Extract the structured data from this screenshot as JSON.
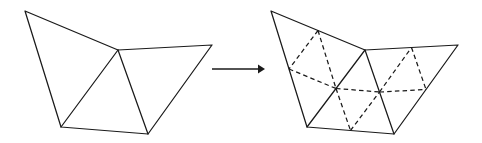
{
  "figure": {
    "description": "A coarse triangular mesh of three triangles is transformed by an arrow into the same mesh with each triangle subdivided into four smaller triangles by dashed midpoint lines.",
    "background_color": "#ffffff",
    "line_color": "#1a1a1a",
    "solid_stroke_width": 1.25,
    "dashed_stroke_width": 1.25,
    "dash_pattern": "4.5 3.2"
  },
  "left_panel": {
    "label": "coarse-mesh",
    "caption": "",
    "vertices": {
      "top_left": {
        "name": "A",
        "x": 25,
        "y": 11
      },
      "apex": {
        "name": "B",
        "x": 118,
        "y": 50
      },
      "right": {
        "name": "C",
        "x": 212,
        "y": 45
      },
      "bottom_left": {
        "name": "D",
        "x": 61,
        "y": 127
      },
      "bottom_mid": {
        "name": "E",
        "x": 148,
        "y": 134
      }
    },
    "outline_path": "M 25 11 L 118 50 L 212 45 L 148 134 L 61 127 Z",
    "interior_edges": [
      {
        "name": "edge-apex-bottom-left",
        "from": "apex",
        "to": "bottom_left"
      },
      {
        "name": "edge-apex-bottom-mid",
        "from": "apex",
        "to": "bottom_mid"
      }
    ],
    "triangles": [
      {
        "name": "triangle-left",
        "vertices": [
          "top_left",
          "apex",
          "bottom_left"
        ]
      },
      {
        "name": "triangle-middle",
        "vertices": [
          "apex",
          "bottom_left",
          "bottom_mid"
        ]
      },
      {
        "name": "triangle-right",
        "vertices": [
          "apex",
          "right",
          "bottom_mid"
        ]
      }
    ]
  },
  "arrow": {
    "label": "transform-arrow",
    "caption": "",
    "shaft_x1": 212,
    "shaft_x2": 258,
    "y": 69,
    "head_points": "258,64.5 265,69 258,73.5"
  },
  "right_panel": {
    "label": "refined-mesh",
    "caption": "",
    "vertices": {
      "top_left": {
        "name": "A'",
        "x": 271,
        "y": 11
      },
      "apex": {
        "name": "B'",
        "x": 365,
        "y": 50
      },
      "right": {
        "name": "C'",
        "x": 458,
        "y": 45
      },
      "bottom_left": {
        "name": "D'",
        "x": 307,
        "y": 127
      },
      "bottom_mid": {
        "name": "E'",
        "x": 394,
        "y": 134
      }
    },
    "outline_path": "M 271 11 L 365 50 L 458 45 L 394 134 L 307 127 Z",
    "interior_edges": [
      {
        "name": "edge-apex-bottom-left",
        "from": "apex",
        "to": "bottom_left"
      },
      {
        "name": "edge-apex-bottom-mid",
        "from": "apex",
        "to": "bottom_mid"
      }
    ],
    "triangles": [
      {
        "name": "triangle-left",
        "vertices": [
          "top_left",
          "apex",
          "bottom_left"
        ]
      },
      {
        "name": "triangle-middle",
        "vertices": [
          "apex",
          "bottom_left",
          "bottom_mid"
        ]
      },
      {
        "name": "triangle-right",
        "vertices": [
          "apex",
          "right",
          "bottom_mid"
        ]
      }
    ],
    "midpoints": {
      "m_topleft_apex": {
        "x": 318,
        "y": 30.5
      },
      "m_topleft_bottomleft": {
        "x": 289,
        "y": 69
      },
      "m_apex_bottomleft": {
        "x": 336,
        "y": 88.5
      },
      "m_bottomleft_bottommid": {
        "x": 350.5,
        "y": 130.5
      },
      "m_apex_bottommid": {
        "x": 379.5,
        "y": 92
      },
      "m_apex_right": {
        "x": 411.5,
        "y": 47.5
      },
      "m_right_bottommid": {
        "x": 426,
        "y": 89.5
      }
    },
    "refinement_edges": [
      {
        "name": "refine-left-1",
        "from": "m_topleft_apex",
        "to": "m_topleft_bottomleft"
      },
      {
        "name": "refine-left-2",
        "from": "m_topleft_apex",
        "to": "m_apex_bottomleft"
      },
      {
        "name": "refine-left-3",
        "from": "m_topleft_bottomleft",
        "to": "m_apex_bottomleft"
      },
      {
        "name": "refine-mid-1",
        "from": "m_apex_bottomleft",
        "to": "m_bottomleft_bottommid"
      },
      {
        "name": "refine-mid-2",
        "from": "m_apex_bottomleft",
        "to": "m_apex_bottommid"
      },
      {
        "name": "refine-mid-3",
        "from": "m_bottomleft_bottommid",
        "to": "m_apex_bottommid"
      },
      {
        "name": "refine-right-1",
        "from": "m_apex_bottommid",
        "to": "m_apex_right"
      },
      {
        "name": "refine-right-2",
        "from": "m_apex_bottommid",
        "to": "m_right_bottommid"
      },
      {
        "name": "refine-right-3",
        "from": "m_apex_right",
        "to": "m_right_bottommid"
      }
    ]
  }
}
